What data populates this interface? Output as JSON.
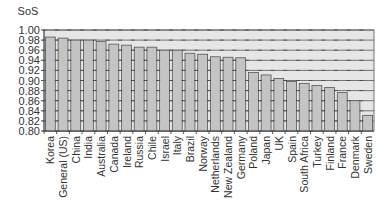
{
  "chart_data": {
    "type": "bar",
    "title": "",
    "xlabel": "",
    "ylabel": "SoS",
    "ylim": [
      0.8,
      1.0
    ],
    "yticks": [
      "1.00",
      "0.98",
      "0.96",
      "0.94",
      "0.92",
      "0.90",
      "0.88",
      "0.86",
      "0.84",
      "0.82",
      "0.80"
    ],
    "grid": true,
    "legend": null,
    "categories": [
      "Korea",
      "General (US)",
      "China",
      "India",
      "Australia",
      "Canada",
      "Ireland",
      "Russia",
      "Chile",
      "Israel",
      "Italy",
      "Brazil",
      "Norway",
      "Netherlands",
      "New Zealand",
      "Germany",
      "Poland",
      "Japan",
      "UK",
      "Spain",
      "South Africa",
      "Turkey",
      "Finland",
      "France",
      "Denmark",
      "Sweden"
    ],
    "values": [
      0.986,
      0.984,
      0.98,
      0.98,
      0.977,
      0.972,
      0.97,
      0.966,
      0.966,
      0.96,
      0.96,
      0.954,
      0.952,
      0.947,
      0.946,
      0.945,
      0.916,
      0.911,
      0.904,
      0.898,
      0.894,
      0.89,
      0.886,
      0.876,
      0.86,
      0.831
    ],
    "colors": {
      "bar": "#c4c4c4",
      "bar_stroke": "#555555",
      "plot_bg": "#e6e6e6",
      "grid": "#555555"
    }
  }
}
